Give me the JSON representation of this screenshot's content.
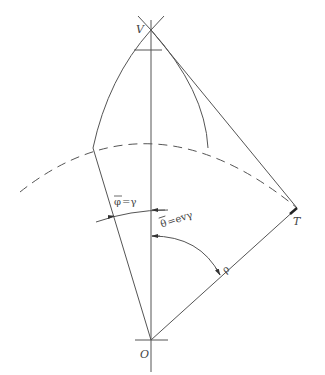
{
  "diagram": {
    "type": "geometric construction",
    "points": {
      "apex": {
        "label": "V",
        "x": 151,
        "y": 30
      },
      "origin": {
        "label": "O",
        "x": 151,
        "y": 340
      },
      "tangent_point": {
        "label": "T",
        "x": 297,
        "y": 208
      }
    },
    "segments": [
      {
        "name": "V-T line",
        "from": "V",
        "to": "T"
      },
      {
        "name": "O-T radius",
        "from": "O",
        "to": "T",
        "label": "ρ"
      },
      {
        "name": "vertical axis",
        "from": "V",
        "to": "O"
      }
    ],
    "arcs": [
      {
        "name": "dashed circle arc",
        "style": "dashed"
      },
      {
        "name": "phi angle",
        "label_main": "φ̄",
        "label_eq": "=γ"
      },
      {
        "name": "theta angle",
        "label_main": "θ̄",
        "label_eq": "=evγ"
      }
    ],
    "labels": {
      "V": "V",
      "O": "O",
      "T": "T",
      "rho": "ρ",
      "phi": "φ",
      "phi_eq": "=γ",
      "theta": "θ",
      "theta_eq": "=evγ"
    }
  }
}
